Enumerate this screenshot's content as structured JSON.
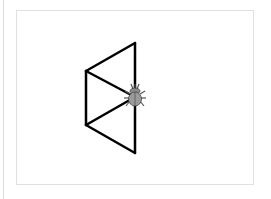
{
  "canvas": {
    "background": "#ffffff",
    "border_color": "#e0e0e0",
    "stroke_color": "#000000",
    "stroke_width": 2.5
  },
  "drawing": {
    "segments": [
      [
        [
          135,
          43
        ],
        [
          86,
          71
        ]
      ],
      [
        [
          86,
          71
        ],
        [
          86,
          125
        ]
      ],
      [
        [
          86,
          125
        ],
        [
          135,
          153
        ]
      ],
      [
        [
          135,
          153
        ],
        [
          135,
          43
        ]
      ],
      [
        [
          86,
          71
        ],
        [
          135,
          97
        ]
      ],
      [
        [
          86,
          125
        ],
        [
          135,
          97
        ]
      ]
    ]
  },
  "sprite": {
    "name": "bug",
    "x": 135,
    "y": 97,
    "color": "#7a7a7a"
  }
}
